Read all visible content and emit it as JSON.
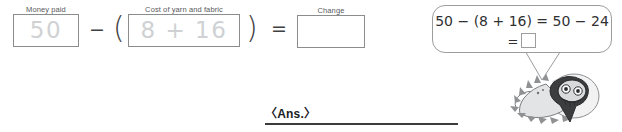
{
  "worksheet": {
    "money_box": {
      "label": "Money paid",
      "value": "50"
    },
    "cost_box": {
      "label": "Cost of yarn and fabric",
      "value": "8 + 16"
    },
    "change_box": {
      "label": "Change",
      "value": ""
    },
    "operators": {
      "minus": "−",
      "left_paren": "(",
      "right_paren": ")",
      "equals": "="
    },
    "answer": {
      "label": "〈Ans.〉"
    }
  },
  "speech_bubble": {
    "line1": "50 − (8 + 16) = 50 − 24",
    "line2_prefix": "=",
    "line2_slot": ""
  },
  "mascot": {
    "name": "dinosaur-mascot"
  }
}
